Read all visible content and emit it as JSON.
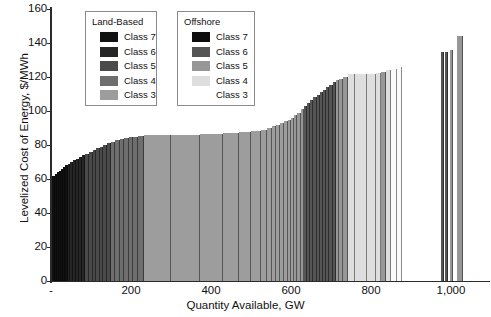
{
  "chart_data": {
    "type": "bar",
    "title": "",
    "xlabel": "Quantity Available, GW",
    "ylabel": "Levelized Cost of Energy, $/MWh",
    "xlim": [
      0,
      1095
    ],
    "ylim": [
      0,
      160
    ],
    "ytick_labels": [
      "0",
      "20",
      "40",
      "60",
      "80",
      "100",
      "120",
      "140",
      "160"
    ],
    "ytick_values": [
      0,
      20,
      40,
      60,
      80,
      100,
      120,
      140,
      160
    ],
    "xtick_labels": [
      "-",
      "200",
      "400",
      "600",
      "800",
      "1,000"
    ],
    "xtick_values": [
      0,
      200,
      400,
      600,
      800,
      1000
    ],
    "grid": false,
    "legend_position": "upper-left-inside",
    "series_note": "Wind resource supply curve: bar width = quantity available (GW), bar height = levelized cost of energy ($/MWh), shaded by resource class and land-based vs offshore.",
    "bars": [
      {
        "x0": 3,
        "x1": 9,
        "value": 62,
        "group": "land",
        "class": "Class 7"
      },
      {
        "x0": 9,
        "x1": 14,
        "value": 63,
        "group": "land",
        "class": "Class 7"
      },
      {
        "x0": 14,
        "x1": 19,
        "value": 64,
        "group": "land",
        "class": "Class 7"
      },
      {
        "x0": 19,
        "x1": 24,
        "value": 65,
        "group": "land",
        "class": "Class 7"
      },
      {
        "x0": 24,
        "x1": 30,
        "value": 66,
        "group": "land",
        "class": "Class 7"
      },
      {
        "x0": 30,
        "x1": 36,
        "value": 67,
        "group": "land",
        "class": "Class 7"
      },
      {
        "x0": 36,
        "x1": 42,
        "value": 68,
        "group": "land",
        "class": "Class 7"
      },
      {
        "x0": 42,
        "x1": 48,
        "value": 69,
        "group": "land",
        "class": "Class 6"
      },
      {
        "x0": 48,
        "x1": 55,
        "value": 70,
        "group": "land",
        "class": "Class 6"
      },
      {
        "x0": 55,
        "x1": 62,
        "value": 71,
        "group": "land",
        "class": "Class 6"
      },
      {
        "x0": 62,
        "x1": 70,
        "value": 72,
        "group": "land",
        "class": "Class 6"
      },
      {
        "x0": 70,
        "x1": 78,
        "value": 73,
        "group": "land",
        "class": "Class 6"
      },
      {
        "x0": 78,
        "x1": 86,
        "value": 74,
        "group": "land",
        "class": "Class 6"
      },
      {
        "x0": 86,
        "x1": 95,
        "value": 75,
        "group": "land",
        "class": "Class 5"
      },
      {
        "x0": 95,
        "x1": 104,
        "value": 76,
        "group": "land",
        "class": "Class 5"
      },
      {
        "x0": 104,
        "x1": 113,
        "value": 77,
        "group": "land",
        "class": "Class 5"
      },
      {
        "x0": 113,
        "x1": 122,
        "value": 78,
        "group": "land",
        "class": "Class 5"
      },
      {
        "x0": 122,
        "x1": 131,
        "value": 79,
        "group": "land",
        "class": "Class 5"
      },
      {
        "x0": 131,
        "x1": 141,
        "value": 80,
        "group": "land",
        "class": "Class 5"
      },
      {
        "x0": 141,
        "x1": 151,
        "value": 81,
        "group": "land",
        "class": "Class 5"
      },
      {
        "x0": 151,
        "x1": 161,
        "value": 82,
        "group": "land",
        "class": "Class 4"
      },
      {
        "x0": 161,
        "x1": 172,
        "value": 83,
        "group": "land",
        "class": "Class 4"
      },
      {
        "x0": 172,
        "x1": 183,
        "value": 83.5,
        "group": "land",
        "class": "Class 4"
      },
      {
        "x0": 183,
        "x1": 194,
        "value": 84,
        "group": "land",
        "class": "Class 4"
      },
      {
        "x0": 194,
        "x1": 206,
        "value": 84.5,
        "group": "land",
        "class": "Class 4"
      },
      {
        "x0": 206,
        "x1": 218,
        "value": 85,
        "group": "land",
        "class": "Class 4"
      },
      {
        "x0": 218,
        "x1": 232,
        "value": 85.5,
        "group": "land",
        "class": "Class 4"
      },
      {
        "x0": 232,
        "x1": 300,
        "value": 86,
        "group": "land",
        "class": "Class 3"
      },
      {
        "x0": 300,
        "x1": 372,
        "value": 86,
        "group": "land",
        "class": "Class 3"
      },
      {
        "x0": 372,
        "x1": 430,
        "value": 86.5,
        "group": "land",
        "class": "Class 3"
      },
      {
        "x0": 430,
        "x1": 470,
        "value": 87,
        "group": "land",
        "class": "Class 3"
      },
      {
        "x0": 470,
        "x1": 500,
        "value": 87.5,
        "group": "land",
        "class": "Class 3"
      },
      {
        "x0": 500,
        "x1": 524,
        "value": 88,
        "group": "land",
        "class": "Class 3"
      },
      {
        "x0": 524,
        "x1": 540,
        "value": 89,
        "group": "land",
        "class": "Class 3"
      },
      {
        "x0": 540,
        "x1": 552,
        "value": 90,
        "group": "land",
        "class": "Class 3"
      },
      {
        "x0": 552,
        "x1": 562,
        "value": 91,
        "group": "land",
        "class": "Class 3"
      },
      {
        "x0": 562,
        "x1": 572,
        "value": 92,
        "group": "land",
        "class": "Class 3"
      },
      {
        "x0": 572,
        "x1": 582,
        "value": 93,
        "group": "land",
        "class": "Class 3"
      },
      {
        "x0": 582,
        "x1": 592,
        "value": 94,
        "group": "land",
        "class": "Class 3"
      },
      {
        "x0": 592,
        "x1": 600,
        "value": 95,
        "group": "land",
        "class": "Class 3"
      },
      {
        "x0": 600,
        "x1": 608,
        "value": 96,
        "group": "land",
        "class": "Class 3"
      },
      {
        "x0": 608,
        "x1": 616,
        "value": 97.5,
        "group": "offshore",
        "class": "Class 5"
      },
      {
        "x0": 616,
        "x1": 624,
        "value": 99,
        "group": "offshore",
        "class": "Class 5"
      },
      {
        "x0": 624,
        "x1": 632,
        "value": 101,
        "group": "offshore",
        "class": "Class 5"
      },
      {
        "x0": 632,
        "x1": 640,
        "value": 103,
        "group": "offshore",
        "class": "Class 6"
      },
      {
        "x0": 640,
        "x1": 648,
        "value": 105,
        "group": "offshore",
        "class": "Class 6"
      },
      {
        "x0": 648,
        "x1": 656,
        "value": 106.5,
        "group": "offshore",
        "class": "Class 6"
      },
      {
        "x0": 656,
        "x1": 664,
        "value": 108,
        "group": "offshore",
        "class": "Class 6"
      },
      {
        "x0": 664,
        "x1": 672,
        "value": 109.5,
        "group": "offshore",
        "class": "Class 6"
      },
      {
        "x0": 672,
        "x1": 680,
        "value": 111,
        "group": "offshore",
        "class": "Class 6"
      },
      {
        "x0": 680,
        "x1": 688,
        "value": 112.5,
        "group": "offshore",
        "class": "Class 6"
      },
      {
        "x0": 688,
        "x1": 696,
        "value": 114,
        "group": "offshore",
        "class": "Class 6"
      },
      {
        "x0": 696,
        "x1": 704,
        "value": 115.5,
        "group": "offshore",
        "class": "Class 6"
      },
      {
        "x0": 704,
        "x1": 712,
        "value": 117,
        "group": "offshore",
        "class": "Class 6"
      },
      {
        "x0": 712,
        "x1": 720,
        "value": 118,
        "group": "offshore",
        "class": "Class 5"
      },
      {
        "x0": 720,
        "x1": 730,
        "value": 119,
        "group": "offshore",
        "class": "Class 5"
      },
      {
        "x0": 730,
        "x1": 742,
        "value": 120,
        "group": "offshore",
        "class": "Class 5"
      },
      {
        "x0": 742,
        "x1": 760,
        "value": 121.5,
        "group": "offshore",
        "class": "Class 4"
      },
      {
        "x0": 760,
        "x1": 790,
        "value": 122,
        "group": "offshore",
        "class": "Class 4"
      },
      {
        "x0": 790,
        "x1": 812,
        "value": 122,
        "group": "offshore",
        "class": "Class 4"
      },
      {
        "x0": 812,
        "x1": 826,
        "value": 122.5,
        "group": "offshore",
        "class": "Class 4"
      },
      {
        "x0": 826,
        "x1": 838,
        "value": 123,
        "group": "offshore",
        "class": "Class 5"
      },
      {
        "x0": 838,
        "x1": 850,
        "value": 124,
        "group": "offshore",
        "class": "Class 4"
      },
      {
        "x0": 850,
        "x1": 866,
        "value": 125,
        "group": "offshore",
        "class": "Class 3"
      },
      {
        "x0": 866,
        "x1": 878,
        "value": 126,
        "group": "offshore",
        "class": "Class 3"
      },
      {
        "x0": 975,
        "x1": 982,
        "value": 135,
        "group": "offshore",
        "class": "Class 6"
      },
      {
        "x0": 986,
        "x1": 993,
        "value": 135,
        "group": "offshore",
        "class": "Class 6"
      },
      {
        "x0": 997,
        "x1": 1005,
        "value": 136,
        "group": "offshore",
        "class": "Class 5"
      },
      {
        "x0": 1014,
        "x1": 1030,
        "value": 144,
        "group": "offshore",
        "class": "Class 5"
      }
    ]
  },
  "legends": [
    {
      "name": "land-based",
      "title": "Land-Based",
      "items": [
        {
          "label": "Class 7",
          "color": "#111111"
        },
        {
          "label": "Class 6",
          "color": "#262626"
        },
        {
          "label": "Class 5",
          "color": "#4a4a4a"
        },
        {
          "label": "Class 4",
          "color": "#6e6e6e"
        },
        {
          "label": "Class 3",
          "color": "#9d9d9d"
        }
      ]
    },
    {
      "name": "offshore",
      "title": "Offshore",
      "items": [
        {
          "label": "Class 7",
          "color": "#0d0d0d"
        },
        {
          "label": "Class 6",
          "color": "#555555"
        },
        {
          "label": "Class 5",
          "color": "#979797"
        },
        {
          "label": "Class 4",
          "color": "#dedede"
        },
        {
          "label": "Class 3",
          "color": "#fbfbfb"
        }
      ]
    }
  ],
  "palette": {
    "land_Class 7": "#111111",
    "land_Class 6": "#262626",
    "land_Class 5": "#4a4a4a",
    "land_Class 4": "#6e6e6e",
    "land_Class 3": "#9d9d9d",
    "offshore_Class 7": "#0d0d0d",
    "offshore_Class 6": "#555555",
    "offshore_Class 5": "#979797",
    "offshore_Class 4": "#dedede",
    "offshore_Class 3": "#fbfbfb",
    "axis": "#2b2b2b",
    "text": "#111111",
    "background": "#ffffff"
  }
}
